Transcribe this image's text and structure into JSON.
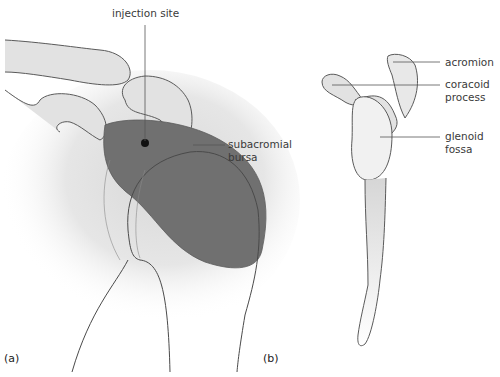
{
  "panels": [
    {
      "id": "a",
      "label": "(a)"
    },
    {
      "id": "b",
      "label": "(b)"
    }
  ],
  "labels": {
    "injection_site": "injection site",
    "subacromial_bursa": "subacromial\nbursa",
    "acromion": "acromion",
    "coracoid_process": "coracoid\nprocess",
    "glenoid_fossa": "glenoid\nfossa"
  },
  "colors": {
    "bone_fill": "#e2e2e2",
    "bursa_fill": "#707070",
    "outline": "#5a5a5a",
    "injection_dot": "#111111",
    "leader_line": "#555555"
  }
}
